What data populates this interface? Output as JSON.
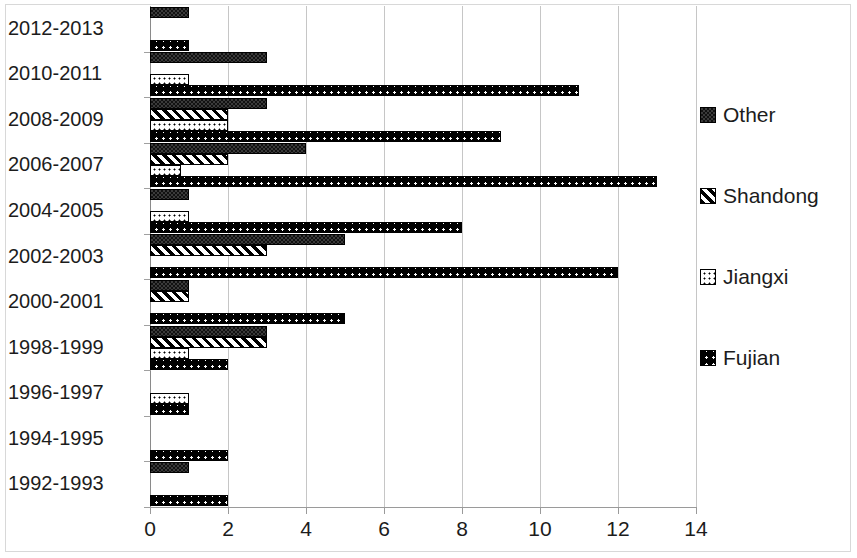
{
  "chart_data": {
    "type": "bar",
    "orientation": "horizontal",
    "title": "",
    "xlabel": "",
    "ylabel": "",
    "xlim": [
      0,
      14
    ],
    "xticks": [
      0,
      2,
      4,
      6,
      8,
      10,
      12,
      14
    ],
    "xtick_labels": [
      "0",
      "2",
      "4",
      "6",
      "8",
      "10",
      "12",
      "14"
    ],
    "grid": true,
    "grid_axis": "x",
    "legend_position": "right",
    "categories": [
      "2012-2013",
      "2010-2011",
      "2008-2009",
      "2006-2007",
      "2004-2005",
      "2002-2003",
      "2000-2001",
      "1998-1999",
      "1996-1997",
      "1994-1995",
      "1992-1993"
    ],
    "series": [
      {
        "name": "Other",
        "pattern": "dark-checker",
        "values": [
          1,
          3,
          3,
          4,
          1,
          5,
          1,
          3,
          0,
          0,
          1
        ]
      },
      {
        "name": "Shandong",
        "pattern": "diagonal-hatch",
        "values": [
          0,
          0,
          2,
          2,
          0,
          3,
          1,
          3,
          0,
          0,
          0
        ]
      },
      {
        "name": "Jiangxi",
        "pattern": "white-dots",
        "values": [
          0,
          1,
          2,
          0.8,
          1,
          0,
          0,
          1,
          1,
          0,
          0
        ]
      },
      {
        "name": "Fujian",
        "pattern": "black-dotted",
        "values": [
          1,
          11,
          9,
          13,
          8,
          12,
          5,
          2,
          1,
          2,
          2
        ]
      }
    ]
  },
  "legend": {
    "items": [
      {
        "label": "Other"
      },
      {
        "label": "Shandong"
      },
      {
        "label": "Jiangxi"
      },
      {
        "label": "Fujian"
      }
    ]
  },
  "colors": {
    "gridline": "#c6c6c6",
    "axis": "#9a9a9a",
    "text": "#1c1c1c",
    "bar_outline": "#000000",
    "background": "#ffffff"
  }
}
